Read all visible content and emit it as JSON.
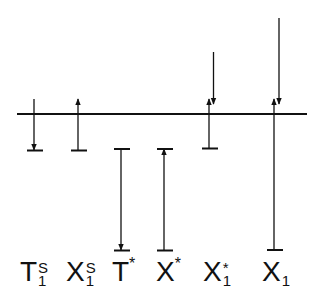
{
  "diagram": {
    "baseline": {
      "x1": 17,
      "x2": 307,
      "y": 114
    },
    "line_color": "#111111",
    "labels": [
      {
        "id": "T1S",
        "base": "T",
        "sub": "1",
        "sup": "S",
        "x": 20
      },
      {
        "id": "X1S",
        "base": "X",
        "sub": "1",
        "sup": "S",
        "x": 66
      },
      {
        "id": "Tstar",
        "base": "T",
        "sub": "",
        "sup": "*",
        "x": 112
      },
      {
        "id": "Xstar",
        "base": "X",
        "sub": "",
        "sup": "*",
        "x": 156
      },
      {
        "id": "X1star",
        "base": "X",
        "sub": "1",
        "sup": "*",
        "x": 203
      },
      {
        "id": "X1",
        "base": "X",
        "sub": "1",
        "sup": "",
        "x": 262
      }
    ],
    "arrows": [
      {
        "for": "T1S",
        "x": 34,
        "from": 99,
        "to": 150,
        "dir": "down",
        "bar": 150
      },
      {
        "for": "X1S",
        "x": 78,
        "from": 150,
        "to": 99,
        "dir": "up",
        "bar": 150
      },
      {
        "for": "Tstar",
        "x": 121,
        "from": 149,
        "to": 250,
        "dir": "down",
        "bars": [
          149,
          250
        ]
      },
      {
        "for": "Xstar",
        "x": 164,
        "from": 250,
        "to": 149,
        "dir": "up",
        "bars": [
          149,
          250
        ]
      },
      {
        "for": "X1star-up",
        "x": 209,
        "from": 148,
        "to": 99,
        "dir": "up",
        "bar": 148
      },
      {
        "for": "X1star-down",
        "x": 213,
        "from": 52,
        "to": 103,
        "dir": "down"
      },
      {
        "for": "X1-up",
        "x": 274,
        "from": 250,
        "to": 99,
        "dir": "up",
        "bar": 250
      },
      {
        "for": "X1-down",
        "x": 279,
        "from": 18,
        "to": 103,
        "dir": "down"
      }
    ]
  }
}
